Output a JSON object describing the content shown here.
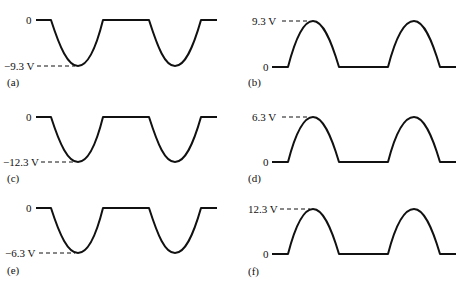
{
  "panels": [
    {
      "id": "a",
      "label": "(a)",
      "polarity": "negative",
      "zero_label": "0",
      "peak_label": "−9.3 V",
      "peak_value_v": -9.3
    },
    {
      "id": "b",
      "label": "(b)",
      "polarity": "positive",
      "zero_label": "0",
      "peak_label": "9.3 V",
      "peak_value_v": 9.3
    },
    {
      "id": "c",
      "label": "(c)",
      "polarity": "negative",
      "zero_label": "0",
      "peak_label": "−12.3 V",
      "peak_value_v": -12.3
    },
    {
      "id": "d",
      "label": "(d)",
      "polarity": "positive",
      "zero_label": "0",
      "peak_label": "6.3 V",
      "peak_value_v": 6.3
    },
    {
      "id": "e",
      "label": "(e)",
      "polarity": "negative",
      "zero_label": "0",
      "peak_label": "−6.3 V",
      "peak_value_v": -6.3
    },
    {
      "id": "f",
      "label": "(f)",
      "polarity": "positive",
      "zero_label": "0",
      "peak_label": "12.3 V",
      "peak_value_v": 12.3
    }
  ],
  "cycles_shown": 2
}
